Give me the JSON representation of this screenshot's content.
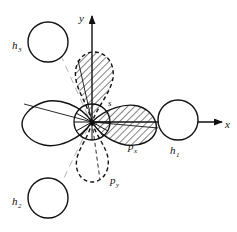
{
  "figure": {
    "name": "orbital-overlap-diagram",
    "background_color": "#ffffff",
    "ink_color": "#111111",
    "hatch_color": "#1a1a1a"
  },
  "axes": {
    "x": {
      "label": "x",
      "direction": "right",
      "origin": {
        "x": 92,
        "y": 122
      },
      "tip": {
        "x": 224,
        "y": 122
      },
      "label_pos": {
        "x": 226,
        "y": 127
      }
    },
    "y": {
      "label": "y",
      "direction": "up",
      "origin": {
        "x": 92,
        "y": 122
      },
      "tip": {
        "x": 92,
        "y": 13
      },
      "label_pos": {
        "x": 80,
        "y": 20
      }
    }
  },
  "orbitals": [
    {
      "id": "px",
      "label": "p",
      "subscript": "x",
      "style": "hatched",
      "outline": "solid",
      "label_pos": {
        "x": 131,
        "y": 148
      },
      "direction": "right"
    },
    {
      "id": "py",
      "label": "p",
      "subscript": "y",
      "style": "open",
      "outline": "dashed",
      "label_pos": {
        "x": 112,
        "y": 182
      },
      "direction": "down"
    },
    {
      "id": "upper-lobe",
      "label": "",
      "subscript": "",
      "style": "hatched",
      "outline": "dashed",
      "label_pos": null,
      "direction": "up"
    },
    {
      "id": "left-lobe",
      "label": "",
      "subscript": "",
      "style": "open",
      "outline": "solid",
      "label_pos": null,
      "direction": "left"
    }
  ],
  "s_orbital": {
    "label": "s",
    "label_pos": {
      "x": 110,
      "y": 106
    },
    "center": {
      "x": 92,
      "y": 122
    },
    "radius": 18
  },
  "hydrogens": [
    {
      "id": "h1",
      "label": "h",
      "subscript": "1",
      "center": {
        "x": 178,
        "y": 120
      },
      "radius": 20,
      "label_pos": {
        "x": 172,
        "y": 152
      }
    },
    {
      "id": "h2",
      "label": "h",
      "subscript": "2",
      "center": {
        "x": 48,
        "y": 198
      },
      "radius": 20,
      "label_pos": {
        "x": 14,
        "y": 204
      }
    },
    {
      "id": "h3",
      "label": "h",
      "subscript": "3",
      "center": {
        "x": 48,
        "y": 42
      },
      "radius": 20,
      "label_pos": {
        "x": 14,
        "y": 48
      }
    }
  ]
}
